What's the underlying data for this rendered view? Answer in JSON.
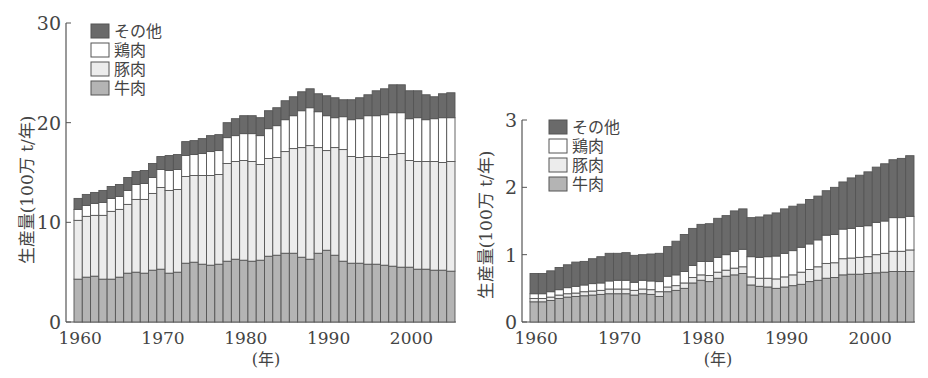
{
  "chart_data": [
    {
      "type": "bar",
      "stacked": true,
      "title": "",
      "xlabel": "(年)",
      "ylabel": "生産量(100万 t/年)",
      "ylim": [
        0,
        30
      ],
      "yticks": [
        0,
        10,
        20,
        30
      ],
      "xticks": [
        1960,
        1970,
        1980,
        1990,
        2000
      ],
      "grid": false,
      "legend_position": "upper-left",
      "legend": [
        "その他",
        "鶏肉",
        "豚肉",
        "牛肉"
      ],
      "categories": [
        1960,
        1961,
        1962,
        1963,
        1964,
        1965,
        1966,
        1967,
        1968,
        1969,
        1970,
        1971,
        1972,
        1973,
        1974,
        1975,
        1976,
        1977,
        1978,
        1979,
        1980,
        1981,
        1982,
        1983,
        1984,
        1985,
        1986,
        1987,
        1988,
        1989,
        1990,
        1991,
        1992,
        1993,
        1994,
        1995,
        1996,
        1997,
        1998,
        1999,
        2000,
        2001,
        2002,
        2003,
        2004,
        2005
      ],
      "series": [
        {
          "name": "牛肉",
          "values": [
            4.3,
            4.5,
            4.6,
            4.3,
            4.3,
            4.5,
            4.9,
            5.0,
            4.9,
            5.2,
            5.3,
            4.9,
            5.0,
            5.9,
            6.0,
            5.8,
            5.7,
            5.8,
            6.1,
            6.3,
            6.2,
            6.1,
            6.2,
            6.6,
            6.7,
            6.9,
            6.9,
            6.5,
            6.3,
            6.9,
            7.2,
            6.7,
            6.1,
            5.9,
            5.9,
            5.8,
            5.8,
            5.7,
            5.6,
            5.5,
            5.5,
            5.3,
            5.3,
            5.2,
            5.2,
            5.1
          ]
        },
        {
          "name": "豚肉",
          "values": [
            5.9,
            6.1,
            6.1,
            6.4,
            6.8,
            6.8,
            6.9,
            7.3,
            7.4,
            7.7,
            8.2,
            8.3,
            8.3,
            8.7,
            8.7,
            8.9,
            9.0,
            9.0,
            9.8,
            9.8,
            10.0,
            10.0,
            9.6,
            9.8,
            9.8,
            10.2,
            10.5,
            11.0,
            11.4,
            10.6,
            10.0,
            10.8,
            11.2,
            10.7,
            10.6,
            10.8,
            10.8,
            10.8,
            11.2,
            11.4,
            10.7,
            10.8,
            10.8,
            10.9,
            10.8,
            11.0
          ]
        },
        {
          "name": "鶏肉",
          "values": [
            1.1,
            1.1,
            1.2,
            1.3,
            1.3,
            1.3,
            1.4,
            1.5,
            1.6,
            1.6,
            1.8,
            2.0,
            2.0,
            2.1,
            2.1,
            2.2,
            2.4,
            2.4,
            2.6,
            2.6,
            2.7,
            2.8,
            2.9,
            3.0,
            3.2,
            3.2,
            3.3,
            3.7,
            3.8,
            3.6,
            3.5,
            3.0,
            3.3,
            3.7,
            3.9,
            4.1,
            4.1,
            4.3,
            4.2,
            4.1,
            4.2,
            4.4,
            4.2,
            4.3,
            4.5,
            4.4
          ]
        },
        {
          "name": "その他",
          "values": [
            1.1,
            1.1,
            1.1,
            1.2,
            1.2,
            1.2,
            1.3,
            1.3,
            1.3,
            1.4,
            1.3,
            1.5,
            1.5,
            1.4,
            1.4,
            1.5,
            1.6,
            1.6,
            1.5,
            1.7,
            1.8,
            1.8,
            1.8,
            1.8,
            1.8,
            1.9,
            1.9,
            1.9,
            1.9,
            1.8,
            2.0,
            2.0,
            1.7,
            2.0,
            2.1,
            2.1,
            2.5,
            2.6,
            2.8,
            2.8,
            2.8,
            2.7,
            2.5,
            2.2,
            2.4,
            2.5
          ]
        }
      ]
    },
    {
      "type": "bar",
      "stacked": true,
      "title": "",
      "xlabel": "(年)",
      "ylabel": "生産量(100万 t/年)",
      "ylim": [
        0,
        3
      ],
      "yticks": [
        0,
        1,
        2,
        3
      ],
      "xticks": [
        1960,
        1970,
        1980,
        1990,
        2000
      ],
      "grid": false,
      "legend_position": "upper-left",
      "legend": [
        "その他",
        "鶏肉",
        "豚肉",
        "牛肉"
      ],
      "categories": [
        1960,
        1961,
        1962,
        1963,
        1964,
        1965,
        1966,
        1967,
        1968,
        1969,
        1970,
        1971,
        1972,
        1973,
        1974,
        1975,
        1976,
        1977,
        1978,
        1979,
        1980,
        1981,
        1982,
        1983,
        1984,
        1985,
        1986,
        1987,
        1988,
        1989,
        1990,
        1991,
        1992,
        1993,
        1994,
        1995,
        1996,
        1997,
        1998,
        1999,
        2000,
        2001,
        2002,
        2003,
        2004,
        2005
      ],
      "series": [
        {
          "name": "牛肉",
          "values": [
            0.3,
            0.3,
            0.32,
            0.35,
            0.37,
            0.38,
            0.39,
            0.4,
            0.41,
            0.42,
            0.42,
            0.42,
            0.4,
            0.42,
            0.41,
            0.38,
            0.45,
            0.47,
            0.5,
            0.58,
            0.62,
            0.6,
            0.65,
            0.68,
            0.7,
            0.72,
            0.55,
            0.53,
            0.52,
            0.5,
            0.52,
            0.54,
            0.56,
            0.6,
            0.62,
            0.65,
            0.66,
            0.7,
            0.71,
            0.71,
            0.72,
            0.73,
            0.74,
            0.75,
            0.75,
            0.75
          ]
        },
        {
          "name": "豚肉",
          "values": [
            0.05,
            0.05,
            0.05,
            0.05,
            0.05,
            0.05,
            0.06,
            0.06,
            0.06,
            0.07,
            0.07,
            0.07,
            0.07,
            0.07,
            0.07,
            0.07,
            0.07,
            0.07,
            0.08,
            0.08,
            0.08,
            0.09,
            0.09,
            0.09,
            0.1,
            0.1,
            0.12,
            0.12,
            0.13,
            0.14,
            0.15,
            0.16,
            0.18,
            0.18,
            0.2,
            0.22,
            0.22,
            0.24,
            0.24,
            0.25,
            0.25,
            0.27,
            0.28,
            0.3,
            0.3,
            0.32
          ]
        },
        {
          "name": "鶏肉",
          "values": [
            0.07,
            0.07,
            0.08,
            0.08,
            0.09,
            0.1,
            0.1,
            0.11,
            0.11,
            0.12,
            0.13,
            0.13,
            0.12,
            0.13,
            0.13,
            0.15,
            0.16,
            0.16,
            0.17,
            0.18,
            0.2,
            0.21,
            0.22,
            0.23,
            0.25,
            0.26,
            0.3,
            0.31,
            0.32,
            0.34,
            0.35,
            0.36,
            0.37,
            0.38,
            0.4,
            0.42,
            0.42,
            0.44,
            0.44,
            0.46,
            0.46,
            0.48,
            0.48,
            0.5,
            0.5,
            0.5
          ]
        },
        {
          "name": "その他",
          "values": [
            0.3,
            0.3,
            0.31,
            0.33,
            0.34,
            0.36,
            0.35,
            0.37,
            0.39,
            0.41,
            0.4,
            0.41,
            0.4,
            0.38,
            0.4,
            0.42,
            0.44,
            0.5,
            0.55,
            0.55,
            0.55,
            0.56,
            0.58,
            0.58,
            0.6,
            0.6,
            0.58,
            0.6,
            0.62,
            0.64,
            0.66,
            0.66,
            0.64,
            0.66,
            0.65,
            0.66,
            0.7,
            0.7,
            0.75,
            0.76,
            0.8,
            0.82,
            0.85,
            0.86,
            0.88,
            0.9
          ]
        }
      ]
    }
  ],
  "style": {
    "colors": {
      "その他": "#6a6a6a",
      "鶏肉": "#ffffff",
      "豚肉": "#ececec",
      "牛肉": "#b4b4b4"
    },
    "edge": "#555555",
    "axis": "#555555"
  }
}
